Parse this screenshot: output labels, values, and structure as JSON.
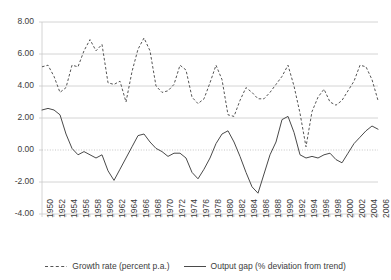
{
  "chart_data": {
    "type": "line",
    "title": "",
    "subtitle": "",
    "xlabel": "",
    "ylabel": "",
    "xlim": [
      1950,
      2006
    ],
    "ylim": [
      -4.0,
      8.0
    ],
    "ytick_labels": [
      "8.00",
      "6.00",
      "4.00",
      "2.00",
      "0.00",
      "-2.00",
      "-4.00"
    ],
    "ytick_values": [
      8,
      6,
      4,
      2,
      0,
      -2,
      -4
    ],
    "xtick_labels": [
      "1950",
      "1952",
      "1954",
      "1956",
      "1958",
      "1960",
      "1962",
      "1964",
      "1966",
      "1968",
      "1970",
      "1972",
      "1974",
      "1976",
      "1978",
      "1980",
      "1982",
      "1984",
      "1986",
      "1988",
      "1990",
      "1992",
      "1994",
      "1996",
      "1998",
      "2000",
      "2002",
      "2004",
      "2006"
    ],
    "grid": "horizontal",
    "zero_line": "dotted",
    "legend_position": "bottom-center",
    "x": [
      1950,
      1951,
      1952,
      1953,
      1954,
      1955,
      1956,
      1957,
      1958,
      1959,
      1960,
      1961,
      1962,
      1963,
      1964,
      1965,
      1966,
      1967,
      1968,
      1969,
      1970,
      1971,
      1972,
      1973,
      1974,
      1975,
      1976,
      1977,
      1978,
      1979,
      1980,
      1981,
      1982,
      1983,
      1984,
      1985,
      1986,
      1987,
      1988,
      1989,
      1990,
      1991,
      1992,
      1993,
      1994,
      1995,
      1996,
      1997,
      1998,
      1999,
      2000,
      2001,
      2002,
      2003,
      2004,
      2005,
      2006
    ],
    "series": [
      {
        "name": "Growth rate (percent p.a.)",
        "style": "dashed",
        "color": "#555555",
        "values": [
          5.2,
          5.3,
          4.6,
          3.6,
          3.9,
          5.3,
          5.2,
          6.2,
          6.9,
          6.2,
          6.6,
          4.2,
          4.1,
          4.3,
          3.0,
          4.9,
          6.3,
          7.0,
          6.2,
          4.0,
          3.6,
          3.7,
          4.1,
          5.3,
          5.0,
          3.3,
          2.9,
          3.2,
          4.2,
          5.3,
          4.4,
          2.2,
          2.1,
          3.1,
          3.9,
          3.6,
          3.2,
          3.2,
          3.6,
          4.1,
          4.6,
          5.3,
          4.0,
          2.3,
          0.2,
          2.4,
          3.3,
          3.8,
          3.0,
          2.8,
          3.1,
          3.7,
          4.3,
          5.3,
          5.2,
          4.4,
          3.1
        ]
      },
      {
        "name": "Output gap (% deviation from trend)",
        "style": "solid",
        "color": "#4a4a4a",
        "values": [
          2.5,
          2.6,
          2.5,
          2.2,
          1.0,
          0.1,
          -0.3,
          -0.1,
          -0.3,
          -0.5,
          -0.3,
          -1.3,
          -1.9,
          -1.2,
          -0.5,
          0.2,
          0.9,
          1.0,
          0.5,
          0.1,
          -0.1,
          -0.4,
          -0.2,
          -0.2,
          -0.5,
          -1.4,
          -1.8,
          -1.2,
          -0.5,
          0.4,
          1.0,
          1.2,
          0.5,
          -0.4,
          -1.4,
          -2.3,
          -2.7,
          -1.5,
          -0.3,
          0.5,
          1.9,
          2.1,
          1.1,
          -0.3,
          -0.5,
          -0.4,
          -0.5,
          -0.3,
          -0.2,
          -0.6,
          -0.8,
          -0.2,
          0.4,
          0.8,
          1.2,
          1.5,
          1.3
        ]
      }
    ]
  },
  "legend": {
    "entries": [
      {
        "label": "Growth rate (percent p.a.)",
        "style": "dashed"
      },
      {
        "label": "Output gap (% deviation from trend)",
        "style": "solid"
      }
    ]
  },
  "colors": {
    "grid": "#c9c9c9",
    "zero_line": "#bfbfbf",
    "axis_text": "#3c3c3c",
    "growth_line": "#555555",
    "output_gap_line": "#4a4a4a",
    "background": "#ffffff"
  }
}
